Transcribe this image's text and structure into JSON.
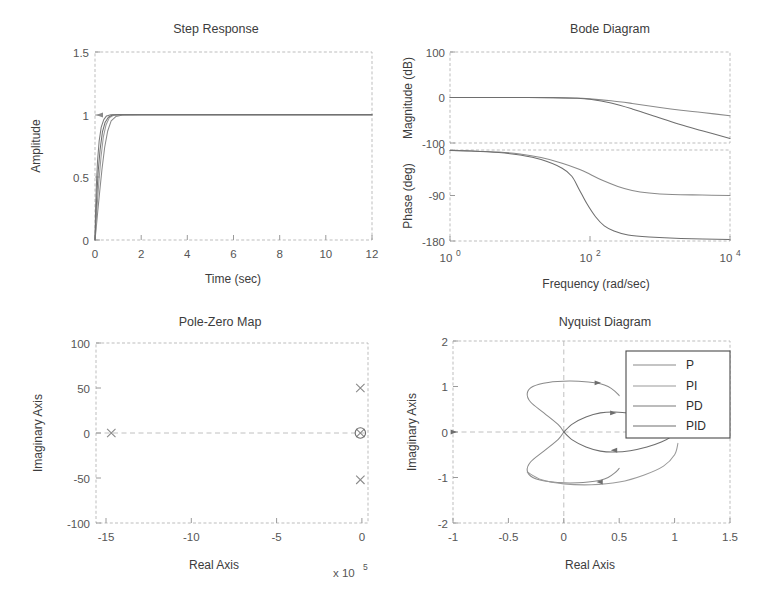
{
  "figure": {
    "title": "",
    "background": "#ffffff",
    "panels": [
      "step-response",
      "bode-diagram",
      "pole-zero-map",
      "nyquist-diagram"
    ]
  },
  "colors": {
    "p": "#8a8a8a",
    "pi": "#9a9a9a",
    "pd": "#7a7a7a",
    "pid": "#6e6e6e",
    "axis": "#bdbdbd",
    "grid": "#d3d3d3",
    "text": "#3c3c3c",
    "tick": "#555555"
  },
  "legend": {
    "position": "upper-right-inside",
    "entries": [
      {
        "label": "P",
        "color": "#8a8a8a"
      },
      {
        "label": "PI",
        "color": "#9a9a9a"
      },
      {
        "label": "PD",
        "color": "#7a7a7a"
      },
      {
        "label": "PID",
        "color": "#6e6e6e"
      }
    ]
  },
  "chart_data": [
    {
      "id": "step-response",
      "type": "line",
      "title": "Step Response",
      "xlabel": "Time (sec)",
      "ylabel": "Amplitude",
      "xlim": [
        0,
        12
      ],
      "ylim": [
        0,
        1.5
      ],
      "xticks": [
        0,
        2,
        4,
        6,
        8,
        10,
        12
      ],
      "xticklabels": [
        "0",
        "2",
        "4",
        "6",
        "8",
        "10",
        "12"
      ],
      "yticks": [
        0,
        0.5,
        1,
        1.5
      ],
      "yticklabels": [
        "0",
        "0.5",
        "1",
        "1.5"
      ],
      "grid": false,
      "series": [
        {
          "name": "P",
          "x": [
            0,
            0.05,
            0.12,
            0.2,
            0.3,
            0.42,
            0.55,
            0.7,
            0.9,
            1.2,
            2,
            4,
            6,
            8,
            10,
            12
          ],
          "y": [
            0,
            0.09,
            0.23,
            0.38,
            0.56,
            0.74,
            0.87,
            0.95,
            0.985,
            0.998,
            1.0,
            1.0,
            1.0,
            1.0,
            1.0,
            1.0
          ]
        },
        {
          "name": "PI",
          "x": [
            0,
            0.04,
            0.1,
            0.17,
            0.26,
            0.36,
            0.48,
            0.62,
            0.8,
            1.1,
            2,
            4,
            6,
            8,
            10,
            12
          ],
          "y": [
            0,
            0.12,
            0.29,
            0.47,
            0.66,
            0.82,
            0.92,
            0.975,
            0.995,
            1.0,
            1.0,
            1.0,
            1.0,
            1.0,
            1.0,
            1.0
          ]
        },
        {
          "name": "PD",
          "x": [
            0,
            0.02,
            0.06,
            0.11,
            0.18,
            0.27,
            0.38,
            0.5,
            0.68,
            0.95,
            2,
            4,
            6,
            8,
            10,
            12
          ],
          "y": [
            0,
            0.2,
            0.44,
            0.63,
            0.79,
            0.9,
            0.96,
            0.99,
            1.0,
            1.0,
            1.0,
            1.0,
            1.0,
            1.0,
            1.0,
            1.0
          ]
        },
        {
          "name": "PID",
          "x": [
            0,
            0.03,
            0.08,
            0.14,
            0.22,
            0.32,
            0.44,
            0.58,
            0.75,
            1.0,
            2,
            4,
            6,
            8,
            10,
            12
          ],
          "y": [
            0,
            0.15,
            0.36,
            0.55,
            0.72,
            0.86,
            0.94,
            0.98,
            0.998,
            1.0,
            1.0,
            1.0,
            1.0,
            1.0,
            1.0,
            1.0
          ]
        }
      ]
    },
    {
      "id": "bode-magnitude",
      "type": "line",
      "title": "Bode Diagram",
      "xlabel": "Frequency  (rad/sec)",
      "ylabel": "Magnitude (dB)",
      "xscale": "log",
      "xlim": [
        1,
        10000
      ],
      "ylim": [
        -100,
        100
      ],
      "xticks": [
        1,
        100,
        10000
      ],
      "xticklabels": [
        "10^0",
        "10^2",
        "10^4"
      ],
      "yticks": [
        -100,
        0,
        100
      ],
      "yticklabels": [
        "-100",
        "0",
        "100"
      ],
      "grid": false,
      "series": [
        {
          "name": "first-order-rolloff",
          "x": [
            1,
            3,
            10,
            30,
            60,
            100,
            200,
            400,
            1000,
            2000,
            4000,
            10000
          ],
          "y": [
            0,
            0,
            0,
            -0.3,
            -1.2,
            -3,
            -7,
            -13,
            -22,
            -28,
            -33,
            -40
          ]
        },
        {
          "name": "second-order-rolloff",
          "x": [
            1,
            3,
            10,
            30,
            60,
            100,
            200,
            400,
            1000,
            2000,
            4000,
            10000
          ],
          "y": [
            0,
            0,
            0,
            -0.4,
            -1.6,
            -4,
            -12,
            -25,
            -45,
            -60,
            -73,
            -90
          ]
        }
      ]
    },
    {
      "id": "bode-phase",
      "type": "line",
      "title": "",
      "xlabel": "Frequency  (rad/sec)",
      "ylabel": "Phase (deg)",
      "xscale": "log",
      "xlim": [
        1,
        10000
      ],
      "ylim": [
        -180,
        0
      ],
      "xticks": [
        1,
        100,
        10000
      ],
      "xticklabels": [
        "10^0",
        "10^2",
        "10^4"
      ],
      "yticks": [
        -180,
        -90,
        0
      ],
      "yticklabels": [
        "-180",
        "-90",
        "0"
      ],
      "grid": false,
      "series": [
        {
          "name": "phase-minus-90",
          "x": [
            1,
            2,
            5,
            10,
            20,
            40,
            70,
            100,
            150,
            250,
            400,
            700,
            1500,
            4000,
            10000
          ],
          "y": [
            -1,
            -2,
            -4,
            -8,
            -15,
            -26,
            -38,
            -48,
            -60,
            -72,
            -80,
            -85,
            -88,
            -89,
            -90
          ]
        },
        {
          "name": "phase-minus-180",
          "x": [
            1,
            2,
            5,
            10,
            20,
            40,
            55,
            70,
            90,
            120,
            160,
            220,
            350,
            700,
            2000,
            10000
          ],
          "y": [
            -1,
            -2,
            -5,
            -10,
            -19,
            -36,
            -52,
            -78,
            -106,
            -132,
            -150,
            -160,
            -168,
            -172,
            -175,
            -177
          ]
        }
      ]
    },
    {
      "id": "pole-zero-map",
      "type": "scatter",
      "title": "Pole-Zero Map",
      "xlabel": "Real Axis",
      "ylabel": "Imaginary Axis",
      "x_exponent": "x 10^5",
      "xlim": [
        -15.6,
        0.4
      ],
      "ylim": [
        -100,
        100
      ],
      "xticks": [
        -15,
        -10,
        -5,
        0
      ],
      "xticklabels": [
        "-15",
        "-10",
        "-5",
        "0"
      ],
      "yticks": [
        -100,
        -50,
        0,
        50,
        100
      ],
      "yticklabels": [
        "-100",
        "-50",
        "0",
        "50",
        "100"
      ],
      "grid": false,
      "poles": [
        {
          "x": -14.7,
          "y": 0,
          "marker": "x"
        },
        {
          "x": -0.05,
          "y": 50,
          "marker": "x"
        },
        {
          "x": -0.05,
          "y": -52,
          "marker": "x"
        },
        {
          "x": -0.05,
          "y": 0,
          "marker": "x"
        }
      ],
      "zeros": [
        {
          "x": -0.05,
          "y": 0,
          "marker": "o"
        }
      ]
    },
    {
      "id": "nyquist-diagram",
      "type": "line",
      "title": "Nyquist Diagram",
      "xlabel": "Real Axis",
      "ylabel": "Imaginary Axis",
      "xlim": [
        -1,
        1.5
      ],
      "ylim": [
        -2,
        2
      ],
      "xticks": [
        -1,
        -0.5,
        0,
        0.5,
        1,
        1.5
      ],
      "xticklabels": [
        "-1",
        "-0.5",
        "0",
        "0.5",
        "1",
        "1.5"
      ],
      "yticks": [
        -2,
        -1,
        0,
        1,
        2
      ],
      "yticklabels": [
        "-2",
        "-1",
        "0",
        "1",
        "2"
      ],
      "grid": false,
      "series": [
        {
          "name": "large-loop-upper",
          "x": [
            0,
            -0.05,
            -0.18,
            -0.3,
            -0.33,
            -0.28,
            -0.14,
            0.05,
            0.22,
            0.33,
            0.4,
            0.46,
            0.5
          ],
          "y": [
            0,
            0.16,
            0.42,
            0.66,
            0.85,
            1.0,
            1.09,
            1.12,
            1.1,
            1.06,
            1.0,
            0.9,
            0.8
          ]
        },
        {
          "name": "large-loop-lower",
          "x": [
            0,
            -0.05,
            -0.18,
            -0.3,
            -0.33,
            -0.28,
            -0.14,
            0.05,
            0.22,
            0.33,
            0.4,
            0.46,
            0.5
          ],
          "y": [
            0,
            -0.16,
            -0.42,
            -0.66,
            -0.85,
            -1.0,
            -1.09,
            -1.12,
            -1.1,
            -1.06,
            -1.0,
            -0.9,
            -0.8
          ]
        },
        {
          "name": "small-loop-upper",
          "x": [
            0,
            0.08,
            0.2,
            0.33,
            0.46,
            0.6,
            0.75,
            0.88,
            0.97,
            1.0
          ],
          "y": [
            0,
            0.18,
            0.33,
            0.42,
            0.44,
            0.41,
            0.33,
            0.22,
            0.1,
            0
          ]
        },
        {
          "name": "small-loop-lower",
          "x": [
            0,
            0.08,
            0.2,
            0.33,
            0.46,
            0.6,
            0.75,
            0.88,
            0.97,
            1.0
          ],
          "y": [
            0,
            -0.18,
            -0.33,
            -0.42,
            -0.44,
            -0.41,
            -0.33,
            -0.22,
            -0.1,
            0
          ]
        },
        {
          "name": "outer-loop-lower",
          "x": [
            -0.33,
            -0.2,
            0.0,
            0.25,
            0.5,
            0.72,
            0.9,
            1.0,
            1.03
          ],
          "y": [
            -0.88,
            -1.05,
            -1.14,
            -1.16,
            -1.1,
            -0.95,
            -0.75,
            -0.5,
            -0.25
          ]
        }
      ],
      "arrow_markers": [
        {
          "x": 0.3,
          "y": 1.08,
          "dir": "right"
        },
        {
          "x": 0.44,
          "y": 0.42,
          "dir": "right"
        },
        {
          "x": 0.33,
          "y": -1.1,
          "dir": "left"
        },
        {
          "x": 0.46,
          "y": -0.4,
          "dir": "left"
        },
        {
          "x": -1.0,
          "y": 0.0,
          "dir": "right"
        }
      ]
    }
  ]
}
